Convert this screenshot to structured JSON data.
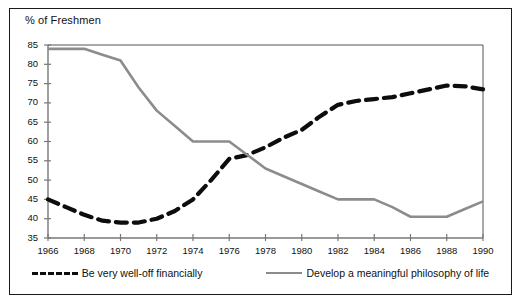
{
  "figure": {
    "axis_title": "% of Freshmen",
    "frame_color": "#1a1a1a",
    "background": "#ffffff"
  },
  "legend": {
    "position": "bottom",
    "entries": [
      {
        "label": "Be very well-off financially",
        "swatch": "dashed-black-line",
        "color": "#0d0d0d"
      },
      {
        "label": "Develop a meaningful philosophy of life",
        "swatch": "solid-gray-line",
        "color": "#8c8c8c"
      }
    ]
  },
  "chart_data": {
    "type": "line",
    "title": "",
    "subtitle": "",
    "xlabel": "",
    "ylabel": "% of Freshmen",
    "xlim": [
      1966,
      1990
    ],
    "ylim": [
      35,
      85
    ],
    "grid": false,
    "legend_position": "bottom",
    "x": [
      1966,
      1967,
      1968,
      1969,
      1970,
      1971,
      1972,
      1973,
      1974,
      1975,
      1976,
      1977,
      1978,
      1979,
      1980,
      1981,
      1982,
      1983,
      1984,
      1985,
      1986,
      1987,
      1988,
      1989,
      1990
    ],
    "xticks": [
      1966,
      1968,
      1970,
      1972,
      1974,
      1976,
      1978,
      1980,
      1982,
      1984,
      1986,
      1988,
      1990
    ],
    "xtick_labels": [
      "1966",
      "1968",
      "1970",
      "1972",
      "1974",
      "1976",
      "1978",
      "1980",
      "1982",
      "1984",
      "1986",
      "1988",
      "1990"
    ],
    "yticks": [
      35,
      40,
      45,
      50,
      55,
      60,
      65,
      70,
      75,
      80,
      85
    ],
    "ytick_labels": [
      "35",
      "40",
      "45",
      "50",
      "55",
      "60",
      "65",
      "70",
      "75",
      "80",
      "85"
    ],
    "series": [
      {
        "name": "Be very well-off financially",
        "style": "dashed",
        "color": "#0d0d0d",
        "values": [
          45.0,
          43.0,
          41.0,
          39.5,
          39.0,
          39.0,
          40.0,
          42.0,
          45.0,
          50.0,
          55.5,
          56.5,
          58.5,
          61.0,
          63.0,
          66.5,
          69.5,
          70.5,
          71.0,
          71.5,
          72.5,
          73.5,
          74.5,
          74.3,
          73.5
        ]
      },
      {
        "name": "Develop a meaningful philosophy of life",
        "style": "solid",
        "color": "#8c8c8c",
        "values": [
          84.0,
          84.0,
          84.0,
          82.5,
          81.0,
          74.0,
          68.0,
          64.0,
          60.0,
          60.0,
          60.0,
          56.5,
          53.0,
          51.0,
          49.0,
          47.0,
          45.0,
          45.0,
          45.0,
          43.0,
          40.5,
          40.5,
          40.5,
          42.5,
          44.5
        ]
      }
    ]
  }
}
